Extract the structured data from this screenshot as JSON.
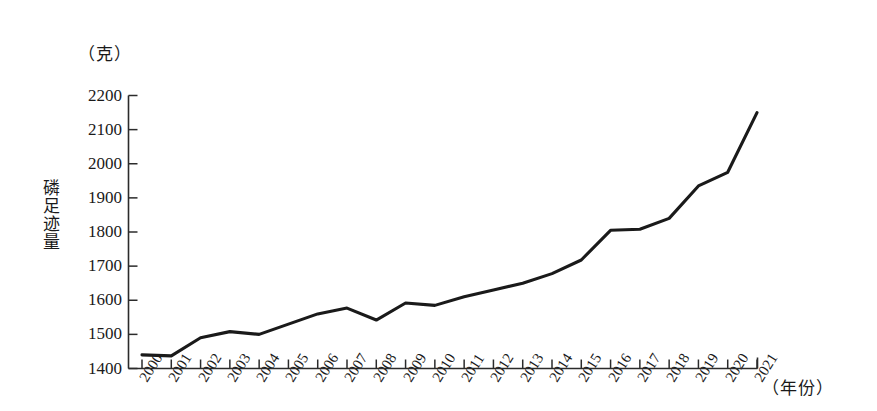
{
  "chart_data": {
    "type": "line",
    "title": "",
    "xlabel": "（年份）",
    "ylabel": "磷足迹量",
    "yunit": "（克）",
    "categories": [
      "2000",
      "2001",
      "2002",
      "2003",
      "2004",
      "2005",
      "2006",
      "2007",
      "2008",
      "2009",
      "2010",
      "2011",
      "2012",
      "2013",
      "2014",
      "2015",
      "2016",
      "2017",
      "2018",
      "2019",
      "2020",
      "2021"
    ],
    "values": [
      1440,
      1437,
      1490,
      1508,
      1500,
      1530,
      1560,
      1577,
      1542,
      1592,
      1585,
      1610,
      1630,
      1650,
      1678,
      1718,
      1805,
      1808,
      1840,
      1935,
      1975,
      2150
    ],
    "ylim": [
      1400,
      2200
    ],
    "ytick_step": 100,
    "yticks": [
      1400,
      1500,
      1600,
      1700,
      1800,
      1900,
      2000,
      2100,
      2200
    ],
    "grid": false,
    "legend": null,
    "legend_position": "none",
    "series_color": "#1a1a1a",
    "axis_color": "#2b2b2b",
    "background": "#ffffff"
  },
  "axes": {
    "y_unit_label": "（克）",
    "y_title_chars": [
      "磷",
      "足",
      "迹",
      "量"
    ],
    "x_unit_label": "（年份）"
  }
}
